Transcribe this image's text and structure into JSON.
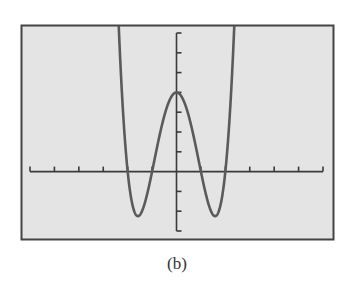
{
  "caption": "(b)",
  "colors": {
    "background": "#ffffff",
    "screen": "#e4e4e4",
    "frame": "#444444",
    "axis": "#3a3a3a",
    "curve": "#5a5a5a"
  },
  "chart_data": {
    "type": "line",
    "title": "",
    "xlabel": "",
    "ylabel": "",
    "function": "y = x^4 - 5x^2 + 4",
    "xlim": [
      -6,
      6
    ],
    "ylim": [
      -3,
      7
    ],
    "x_tick_step": 1,
    "y_tick_step": 1,
    "grid": false,
    "legend": null,
    "x_ticks": [
      -6,
      -5,
      -4,
      -3,
      -2,
      -1,
      0,
      1,
      2,
      3,
      4,
      5,
      6
    ],
    "y_ticks": [
      -3,
      -2,
      -1,
      0,
      1,
      2,
      3,
      4,
      5,
      6,
      7
    ],
    "key_points": {
      "x_intercepts": [
        -2,
        -1,
        1,
        2
      ],
      "y_intercept": 4,
      "local_max": [
        0,
        4
      ],
      "local_mins": [
        [
          -1.58,
          -2.25
        ],
        [
          1.58,
          -2.25
        ]
      ]
    },
    "series": [
      {
        "name": "f(x)",
        "x": [
          -2.5,
          -2.4,
          -2.3,
          -2.2,
          -2.1,
          -2.0,
          -1.9,
          -1.8,
          -1.7,
          -1.6,
          -1.5,
          -1.4,
          -1.3,
          -1.2,
          -1.1,
          -1.0,
          -0.9,
          -0.8,
          -0.7,
          -0.6,
          -0.5,
          -0.4,
          -0.3,
          -0.2,
          -0.1,
          0.0,
          0.1,
          0.2,
          0.3,
          0.4,
          0.5,
          0.6,
          0.7,
          0.8,
          0.9,
          1.0,
          1.1,
          1.2,
          1.3,
          1.4,
          1.5,
          1.6,
          1.7,
          1.8,
          1.9,
          2.0,
          2.1,
          2.2,
          2.3,
          2.4,
          2.5
        ],
        "values": [
          11.81,
          8.38,
          5.53,
          3.23,
          1.4,
          0.0,
          -1.02,
          -1.7,
          -2.1,
          -2.25,
          -2.19,
          -1.96,
          -1.59,
          -1.13,
          -0.59,
          0.0,
          0.61,
          1.21,
          1.79,
          2.33,
          2.81,
          3.23,
          3.56,
          3.8,
          3.95,
          4.0,
          3.95,
          3.8,
          3.56,
          3.23,
          2.81,
          2.33,
          1.79,
          1.21,
          0.61,
          0.0,
          -0.59,
          -1.13,
          -1.59,
          -1.96,
          -2.19,
          -2.25,
          -2.1,
          -1.7,
          -1.02,
          0.0,
          1.4,
          3.23,
          5.53,
          8.38,
          11.81
        ]
      }
    ]
  }
}
